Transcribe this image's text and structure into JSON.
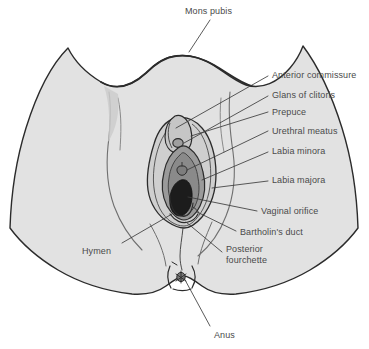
{
  "figure": {
    "view": "anterior / lithotomy view",
    "colors": {
      "background": "#ffffff",
      "body_fill": "#e2e2e2",
      "body_outline": "#2b2b2b",
      "labia_majora_fill": "#cfcfcf",
      "labia_minora_fill": "#9a9a9a",
      "vestibule_fill": "#8a8a8a",
      "vaginal_orifice_fill": "#1c1c1c",
      "leader_line": "#3c3c3c",
      "text": "#4a4a4a"
    }
  },
  "labels": [
    {
      "id": "mons-pubis",
      "text": "Mons pubis",
      "x": 185,
      "y": 6,
      "align": "left"
    },
    {
      "id": "anterior-commissure",
      "text": "Anterior commissure",
      "x": 272,
      "y": 70,
      "align": "left"
    },
    {
      "id": "glans-of-clitoris",
      "text": "Glans of clitoris",
      "x": 272,
      "y": 90,
      "align": "left"
    },
    {
      "id": "prepuce",
      "text": "Prepuce",
      "x": 272,
      "y": 107,
      "align": "left"
    },
    {
      "id": "urethral-meatus",
      "text": "Urethral meatus",
      "x": 272,
      "y": 126,
      "align": "left"
    },
    {
      "id": "labia-minora",
      "text": "Labia minora",
      "x": 272,
      "y": 146,
      "align": "left"
    },
    {
      "id": "labia-majora",
      "text": "Labia majora",
      "x": 272,
      "y": 175,
      "align": "left"
    },
    {
      "id": "vaginal-orifice",
      "text": "Vaginal orifice",
      "x": 261,
      "y": 206,
      "align": "left"
    },
    {
      "id": "bartholins-duct",
      "text": "Bartholin's duct",
      "x": 240,
      "y": 227,
      "align": "left"
    },
    {
      "id": "posterior-fourchette",
      "text": "Posterior\nfourchette",
      "x": 226,
      "y": 244,
      "align": "left"
    },
    {
      "id": "hymen",
      "text": "Hymen",
      "x": 82,
      "y": 246,
      "align": "left"
    },
    {
      "id": "anus",
      "text": "Anus",
      "x": 214,
      "y": 330,
      "align": "left"
    }
  ],
  "leader_lines": [
    {
      "id": "leader-mons-pubis",
      "points": "210,20 189,52"
    },
    {
      "id": "leader-anterior-commissure",
      "points": "268,76 176,128"
    },
    {
      "id": "leader-glans-of-clitoris",
      "points": "268,96 170,144"
    },
    {
      "id": "leader-prepuce",
      "points": "268,112 170,138"
    },
    {
      "id": "leader-urethral-meatus",
      "points": "268,131 172,172"
    },
    {
      "id": "leader-labia-minora",
      "points": "268,152 176,178"
    },
    {
      "id": "leader-labia-majora",
      "points": "268,181 208,186"
    },
    {
      "id": "leader-vaginal-orifice",
      "points": "257,211 176,197"
    },
    {
      "id": "leader-bartholins-duct",
      "points": "236,231 188,214"
    },
    {
      "id": "leader-posterior-fourchette",
      "points": "222,252 180,219"
    },
    {
      "id": "leader-hymen",
      "points": "122,243 166,213"
    },
    {
      "id": "leader-anus",
      "points": "210,326 175,272"
    }
  ],
  "structures": [
    {
      "id": "body-outline",
      "name": "Perineum and thigh outline"
    },
    {
      "id": "mons-crease",
      "name": "Mons pubis crease"
    },
    {
      "id": "left-groin-crease",
      "name": "Left groin crease"
    },
    {
      "id": "right-groin-crease",
      "name": "Right groin crease"
    },
    {
      "id": "labia-majora-shape",
      "name": "Labia majora"
    },
    {
      "id": "labia-minora-shape",
      "name": "Labia minora"
    },
    {
      "id": "prepuce-shape",
      "name": "Prepuce"
    },
    {
      "id": "glans-clitoris-shape",
      "name": "Glans of clitoris"
    },
    {
      "id": "urethral-meatus-shape",
      "name": "Urethral meatus"
    },
    {
      "id": "vaginal-orifice-shape",
      "name": "Vaginal orifice"
    },
    {
      "id": "hymen-shape",
      "name": "Hymen"
    },
    {
      "id": "posterior-fourchette-shape",
      "name": "Posterior fourchette"
    },
    {
      "id": "perineal-raphe",
      "name": "Perineal raphe"
    },
    {
      "id": "anus-shape",
      "name": "Anus"
    }
  ]
}
